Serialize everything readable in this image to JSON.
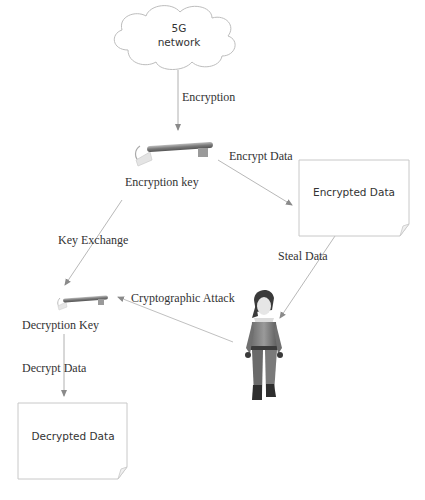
{
  "diagram": {
    "nodes": {
      "network": {
        "label_line1": "5G",
        "label_line2": "network",
        "shape": "cloud"
      },
      "encryption_key": {
        "label": "Encryption key",
        "icon": "key-icon"
      },
      "encrypted_data": {
        "label": "Encrypted Data",
        "shape": "document"
      },
      "decryption_key": {
        "label": "Decryption Key",
        "icon": "key-icon"
      },
      "attacker": {
        "icon": "person-icon"
      },
      "decrypted_data": {
        "label": "Decrypted Data",
        "shape": "document"
      }
    },
    "edges": {
      "encryption": "Encryption",
      "encrypt_data": "Encrypt Data",
      "key_exchange": "Key Exchange",
      "steal_data": "Steal Data",
      "cryptographic_attack": "Cryptographic Attack",
      "decrypt_data": "Decrypt Data"
    },
    "colors": {
      "line": "#b0b0b0",
      "arrow": "#8a8a8a",
      "text": "#333333",
      "box_border": "#c8c8c8"
    }
  }
}
